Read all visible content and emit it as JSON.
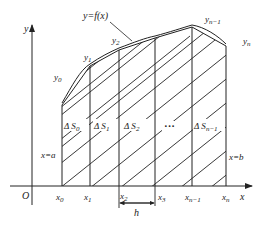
{
  "diagram": {
    "curve_label": "y=f(x)",
    "axes": {
      "x_label": "x",
      "y_label": "y",
      "origin_label": "O"
    },
    "boundaries": {
      "left": "x=a",
      "right": "x=b"
    },
    "step_label": "h",
    "ellipsis": "···",
    "x_ticks": [
      {
        "base": "x",
        "sub": "0"
      },
      {
        "base": "x",
        "sub": "1"
      },
      {
        "base": "x",
        "sub": "2"
      },
      {
        "base": "x",
        "sub": "3"
      },
      {
        "base": "x",
        "sub": "n−1"
      },
      {
        "base": "x",
        "sub": "n"
      }
    ],
    "y_values": [
      {
        "base": "y",
        "sub": "0"
      },
      {
        "base": "y",
        "sub": "1"
      },
      {
        "base": "y",
        "sub": "2"
      },
      {
        "base": "y",
        "sub": "n−1"
      },
      {
        "base": "y",
        "sub": "n"
      }
    ],
    "areas": [
      {
        "prefix": "Δ S",
        "sub": "0"
      },
      {
        "prefix": "Δ S",
        "sub": "1"
      },
      {
        "prefix": "Δ S",
        "sub": "2"
      },
      {
        "prefix": "Δ S",
        "sub": "n−1"
      }
    ],
    "colors": {
      "line": "#222222",
      "background": "#ffffff"
    }
  }
}
